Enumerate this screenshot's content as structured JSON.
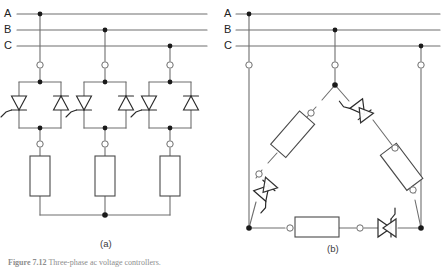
{
  "figure": {
    "caption_label": "Figure 7.12",
    "caption_text": "Three-phase ac voltage controllers.",
    "sub_captions": [
      {
        "id": "a",
        "label": "(a)"
      },
      {
        "id": "b",
        "label": "(b)"
      }
    ]
  },
  "diagram_a": {
    "name": "wye-connected-three-phase-ac-voltage-controller",
    "phase_labels": [
      "A",
      "B",
      "C"
    ],
    "bus_lines": [
      {
        "label": "A",
        "y": 14
      },
      {
        "label": "B",
        "y": 30
      },
      {
        "label": "C",
        "y": 46
      },
      {
        "label": "N",
        "y": 0
      }
    ],
    "branch_count": 3,
    "branches": [
      {
        "phase": "A",
        "x": 40,
        "tap_y": 14
      },
      {
        "phase": "B",
        "x": 105,
        "tap_y": 30
      },
      {
        "phase": "C",
        "x": 170,
        "tap_y": 46
      }
    ],
    "components": {
      "thyristor_pair": "anti-parallel-scr-pair",
      "load": "resistor-load",
      "terminal": "open-terminal-node",
      "junction": "solid-junction-node"
    },
    "neutral_label": ""
  },
  "diagram_b": {
    "name": "delta-connected-three-phase-ac-voltage-controller",
    "phase_labels": [
      "A",
      "B",
      "C"
    ],
    "bus_lines": [
      {
        "label": "A",
        "y": 14
      },
      {
        "label": "B",
        "y": 30
      },
      {
        "label": "C",
        "y": 46
      }
    ],
    "vertices": [
      {
        "id": "top",
        "x": 335,
        "y": 85
      },
      {
        "id": "bottom-left",
        "x": 249,
        "y": 228
      },
      {
        "id": "bottom-right",
        "x": 421,
        "y": 228
      }
    ],
    "branch_drops": [
      {
        "phase": "A",
        "x": 249,
        "tap_y": 14
      },
      {
        "phase": "B",
        "x": 335,
        "tap_y": 30
      },
      {
        "phase": "C",
        "x": 421,
        "tap_y": 46
      }
    ],
    "delta_legs": [
      {
        "from": "top",
        "to": "bottom-left",
        "elements": [
          "resistor-load",
          "thyristor-pair"
        ]
      },
      {
        "from": "top",
        "to": "bottom-right",
        "elements": [
          "thyristor-pair",
          "resistor-load"
        ]
      },
      {
        "from": "bottom-left",
        "to": "bottom-right",
        "elements": [
          "resistor-load",
          "thyristor-pair"
        ]
      }
    ]
  },
  "colors": {
    "wire": "#6e6e6e",
    "wire_dark": "#4a4a4a",
    "component_stroke": "#2a2a2a",
    "node_fill": "#1a1a1a",
    "terminal_fill": "#ffffff",
    "background": "#ffffff",
    "caption": "#8d8d8d"
  }
}
